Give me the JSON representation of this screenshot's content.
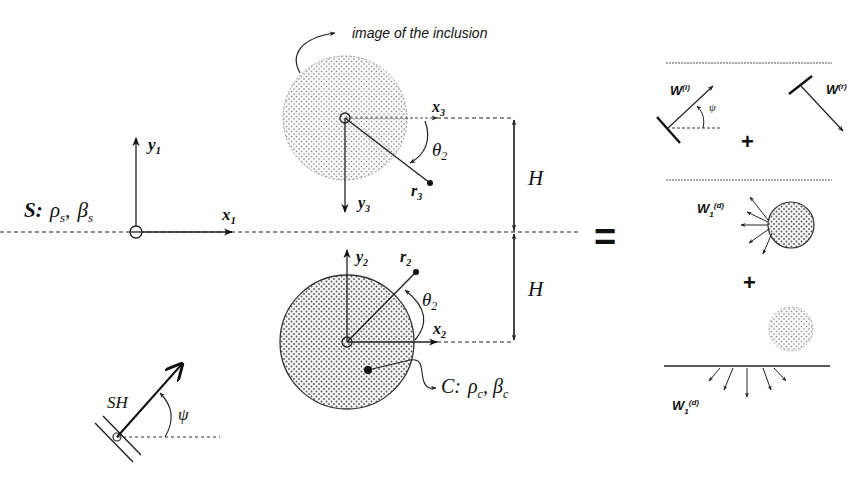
{
  "diagram": {
    "left_panel": {
      "half_space": {
        "label_prefix": "S:",
        "rho": "ρ",
        "rho_sub": "s",
        "beta": "β",
        "beta_sub": "s",
        "full_text": "S: ρs, βs"
      },
      "axes_1": {
        "x": "x",
        "x_sub": "1",
        "y": "y",
        "y_sub": "1"
      },
      "image_annotation": "image of the inclusion",
      "image_inclusion": {
        "axes": {
          "x": "x",
          "x_sub": "3",
          "y": "y",
          "y_sub": "3"
        },
        "radius_label": "r",
        "radius_sub": "3",
        "angle_label": "θ",
        "angle_sub": "2"
      },
      "inclusion": {
        "axes": {
          "x": "x",
          "x_sub": "2",
          "y": "y",
          "y_sub": "2"
        },
        "radius_label": "r",
        "radius_sub": "2",
        "angle_label": "θ",
        "angle_sub": "2",
        "material_prefix": "C:",
        "rho": "ρ",
        "rho_sub": "c",
        "beta": "β",
        "beta_sub": "c",
        "full_text": "C: ρc, βc"
      },
      "depth_labels": [
        "H",
        "H"
      ],
      "incident_wave": {
        "label": "SH",
        "angle": "ψ"
      }
    },
    "equals_sign": "=",
    "right_panel": {
      "row1": {
        "incident": {
          "label": "W",
          "sup": "(i)",
          "angle": "ψ"
        },
        "plus": "+",
        "reflected": {
          "label": "W",
          "sup": "(r)"
        }
      },
      "row2": {
        "diffracted_inclusion": {
          "label": "W",
          "sub": "1",
          "sup": "(d)"
        },
        "plus": "+"
      },
      "row3": {
        "diffracted_surface": {
          "label": "W",
          "sub": "1",
          "sup": "(d)"
        }
      }
    }
  }
}
